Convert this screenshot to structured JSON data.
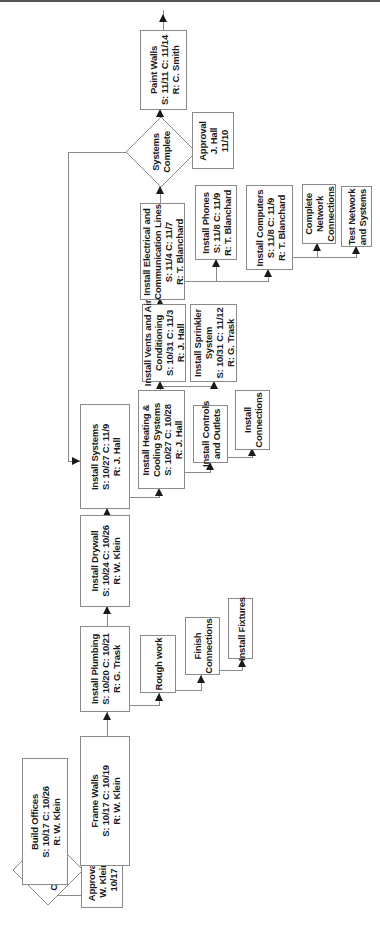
{
  "diagram": {
    "orientation": "rotated-90-ccw",
    "decisions": {
      "plans_complete": {
        "line1": "Plans",
        "line2": "Complete"
      },
      "systems_complete": {
        "line1": "Systems",
        "line2": "Complete"
      }
    },
    "approvals": {
      "plans": {
        "line1": "Approval:",
        "line2": "W. Klein",
        "line3": "10/17"
      },
      "systems": {
        "line1": "Approval",
        "line2": "J. Hall",
        "line3": "11/10"
      }
    },
    "tasks": {
      "build_offices": {
        "title": "Build Offices",
        "dates": "S: 10/17  C: 10/26",
        "resp": "R: W. Klein"
      },
      "frame_walls": {
        "title": "Frame Walls",
        "dates": "S: 10/17 C: 10/19",
        "resp": "R: W. Klein"
      },
      "install_plumbing": {
        "title": "Install Plumbing",
        "dates": "S: 10/20 C: 10/21",
        "resp": "R: G. Trask"
      },
      "rough_work": {
        "title": "Rough work"
      },
      "finish_connections": {
        "line1": "Finish",
        "line2": "Connections"
      },
      "install_fixtures": {
        "title": "Install Fixtures"
      },
      "install_drywall": {
        "title": "Install Drywall",
        "dates": "S: 10/24 C: 10/26",
        "resp": "R: W. Klein"
      },
      "install_systems": {
        "title": "Install Systems",
        "dates": "S: 10/27 C: 11/9",
        "resp": "R: J. Hall"
      },
      "install_heating": {
        "line1": "Install Heating &",
        "line2": "Cooling Systems",
        "dates": "S: 10/27 C: 10/28",
        "resp": "R: J. Hall"
      },
      "install_controls": {
        "line1": "Install Controls",
        "line2": "and Outlets"
      },
      "install_connections": {
        "line1": "Install",
        "line2": "Connections"
      },
      "install_vents": {
        "line1": "Install Vents and Air",
        "line2": "Conditioning",
        "dates": "S: 10/31 C: 11/3",
        "resp": "R: J. Hall"
      },
      "install_sprinkler": {
        "line1": "Install Sprinkler",
        "line2": "System",
        "dates": "S: 10/31 C: 11/12",
        "resp": "R: G. Trask"
      },
      "install_electrical": {
        "line1": "Install Electrical and",
        "line2": "Communication Lines",
        "dates": "S: 11/4 C: 11/7",
        "resp": "R: T. Blanchard"
      },
      "install_phones": {
        "title": "Install Phones",
        "dates": "S: 11/8  C: 11/9",
        "resp": "R: T. Blanchard"
      },
      "install_computers": {
        "title": "Install Computers",
        "dates": "S: 11/8  C: 11/9",
        "resp": "R: T. Blanchard"
      },
      "complete_network": {
        "line1": "Complete",
        "line2": "Network",
        "line3": "Connections"
      },
      "test_network": {
        "line1": "Test Network",
        "line2": "and Systems"
      },
      "paint_walls": {
        "title": "Paint Walls",
        "dates": "S: 11/11 C: 11/14",
        "resp": "R: C. Smith"
      }
    }
  }
}
